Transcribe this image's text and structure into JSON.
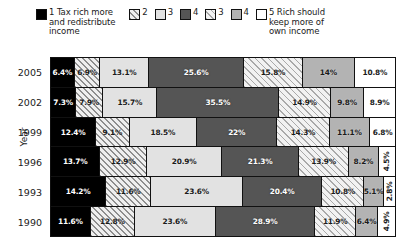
{
  "chart_data": {
    "type": "bar",
    "orientation": "horizontal",
    "stacked": true,
    "stack_mode": "100%",
    "title": "",
    "xlabel": "",
    "ylabel": "Year",
    "xlim": [
      0,
      100
    ],
    "grid": false,
    "legend_position": "top",
    "categories": [
      "2005",
      "2002",
      "1999",
      "1996",
      "1993",
      "1990"
    ],
    "series": [
      {
        "name": "1 Tax rich more and redistribute income",
        "key": "s1",
        "color": "#000000",
        "pattern": "solid-black",
        "values": [
          6.4,
          7.3,
          12.4,
          13.7,
          14.2,
          11.6
        ]
      },
      {
        "name": "2",
        "key": "s2",
        "color": "#efefef",
        "pattern": "diagonal-hatch-dark",
        "values": [
          6.9,
          7.9,
          9.1,
          12.9,
          11.6,
          12.8
        ]
      },
      {
        "name": "3",
        "key": "s3",
        "color": "#e2e2e2",
        "pattern": "solid-light-gray",
        "values": [
          13.1,
          15.7,
          18.5,
          20.9,
          23.6,
          23.6
        ]
      },
      {
        "name": "4",
        "key": "s4",
        "color": "#555555",
        "pattern": "solid-dark-gray",
        "values": [
          25.6,
          35.5,
          22.0,
          21.3,
          20.4,
          28.9
        ]
      },
      {
        "name": "3",
        "key": "s5",
        "color": "#f2f2f2",
        "pattern": "diagonal-hatch-light",
        "values": [
          15.8,
          14.9,
          14.3,
          13.9,
          10.8,
          11.9
        ]
      },
      {
        "name": "4",
        "key": "s6",
        "color": "#b3b3b3",
        "pattern": "solid-medium-gray",
        "values": [
          14.0,
          9.8,
          11.1,
          8.2,
          5.1,
          6.4
        ]
      },
      {
        "name": "5 Rich should keep more of own income",
        "key": "s7",
        "color": "#ffffff",
        "pattern": "solid-white",
        "values": [
          10.8,
          8.9,
          6.8,
          4.5,
          2.8,
          4.9
        ]
      }
    ],
    "rows": [
      {
        "year": "2005",
        "labels": [
          "6.4%",
          "6.9%",
          "13.1%",
          "25.6%",
          "15.8%",
          "14%",
          "10.8%"
        ]
      },
      {
        "year": "2002",
        "labels": [
          "7.3%",
          "7.9%",
          "15.7%",
          "35.5%",
          "14.9%",
          "9.8%",
          "8.9%"
        ]
      },
      {
        "year": "1999",
        "labels": [
          "12.4%",
          "9.1%",
          "18.5%",
          "22%",
          "14.3%",
          "11.1%",
          "6.8%"
        ]
      },
      {
        "year": "1996",
        "labels": [
          "13.7%",
          "12.9%",
          "20.9%",
          "21.3%",
          "13.9%",
          "8.2%",
          "4.5%"
        ]
      },
      {
        "year": "1993",
        "labels": [
          "14.2%",
          "11.6%",
          "23.6%",
          "20.4%",
          "10.8%",
          "5.1%",
          "2.8%"
        ]
      },
      {
        "year": "1990",
        "labels": [
          "11.6%",
          "12.8%",
          "23.6%",
          "28.9%",
          "11.9%",
          "6.4%",
          "4.9%"
        ]
      }
    ]
  },
  "legend": {
    "entries": [
      {
        "label": "1 Tax rich more\nand redistribute\nincome",
        "swatch": "f-s1"
      },
      {
        "label": "2",
        "swatch": "f-s2"
      },
      {
        "label": "3",
        "swatch": "f-s3"
      },
      {
        "label": "4",
        "swatch": "f-s4"
      },
      {
        "label": "3",
        "swatch": "f-s5"
      },
      {
        "label": "4",
        "swatch": "f-s6"
      },
      {
        "label": "5 Rich should\nkeep more of\nown income",
        "swatch": "f-s7"
      }
    ]
  },
  "axis": {
    "y_title": "Year"
  }
}
